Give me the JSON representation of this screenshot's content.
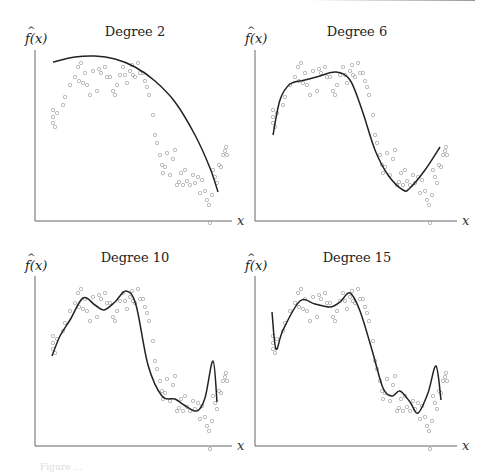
{
  "figure": {
    "caption_fragment": "Figure ..."
  },
  "chart_data": [
    {
      "type": "scatter",
      "title": "Degree 2",
      "xlabel": "x",
      "ylabel": "̂f(x)",
      "grid": false,
      "fit_curve": "polynomial degree 2",
      "curve_px": [
        [
          53,
          62
        ],
        [
          75,
          57
        ],
        [
          95,
          56
        ],
        [
          115,
          59
        ],
        [
          135,
          67
        ],
        [
          155,
          81
        ],
        [
          175,
          102
        ],
        [
          195,
          135
        ],
        [
          210,
          168
        ],
        [
          218,
          192
        ]
      ]
    },
    {
      "type": "scatter",
      "title": "Degree 6",
      "xlabel": "x",
      "ylabel": "̂f(x)",
      "grid": false,
      "fit_curve": "polynomial degree 6",
      "curve_px": [
        [
          273,
          135
        ],
        [
          280,
          100
        ],
        [
          290,
          84
        ],
        [
          305,
          80
        ],
        [
          320,
          76
        ],
        [
          336,
          72
        ],
        [
          350,
          80
        ],
        [
          362,
          110
        ],
        [
          375,
          150
        ],
        [
          388,
          175
        ],
        [
          403,
          190
        ],
        [
          410,
          188
        ],
        [
          425,
          170
        ],
        [
          440,
          147
        ]
      ]
    },
    {
      "type": "scatter",
      "title": "Degree 10",
      "xlabel": "x",
      "ylabel": "̂f(x)",
      "grid": false,
      "fit_curve": "polynomial degree 10",
      "curve_px": [
        [
          52,
          356
        ],
        [
          60,
          336
        ],
        [
          70,
          320
        ],
        [
          83,
          298
        ],
        [
          95,
          305
        ],
        [
          104,
          310
        ],
        [
          115,
          302
        ],
        [
          126,
          291
        ],
        [
          136,
          305
        ],
        [
          148,
          365
        ],
        [
          162,
          396
        ],
        [
          175,
          399
        ],
        [
          184,
          405
        ],
        [
          197,
          411
        ],
        [
          205,
          398
        ],
        [
          213,
          361
        ],
        [
          217,
          402
        ]
      ]
    },
    {
      "type": "scatter",
      "title": "Degree 15",
      "xlabel": "x",
      "ylabel": "̂f(x)",
      "grid": false,
      "fit_curve": "polynomial degree 15",
      "curve_px": [
        [
          272,
          312
        ],
        [
          276,
          349
        ],
        [
          283,
          330
        ],
        [
          300,
          301
        ],
        [
          315,
          304
        ],
        [
          330,
          307
        ],
        [
          340,
          302
        ],
        [
          350,
          293
        ],
        [
          360,
          311
        ],
        [
          372,
          350
        ],
        [
          383,
          388
        ],
        [
          392,
          396
        ],
        [
          400,
          391
        ],
        [
          410,
          402
        ],
        [
          418,
          413
        ],
        [
          428,
          393
        ],
        [
          436,
          366
        ],
        [
          441,
          400
        ]
      ]
    }
  ]
}
